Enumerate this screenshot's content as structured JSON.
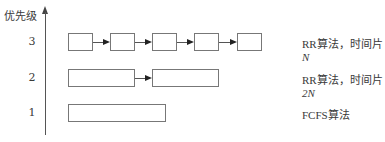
{
  "y_axis": {
    "label": "优先级"
  },
  "queues": [
    {
      "level": "3",
      "algorithm": "RR算法，时间片",
      "quantum": "N",
      "box_count": 5
    },
    {
      "level": "2",
      "algorithm": "RR算法，时间片",
      "quantum": "2N",
      "box_count": 2
    },
    {
      "level": "1",
      "algorithm": "FCFS算法",
      "quantum": "",
      "box_count": 1
    }
  ],
  "colors": {
    "line": "#555555",
    "box_border": "#777777",
    "text": "#3a3a3a"
  }
}
